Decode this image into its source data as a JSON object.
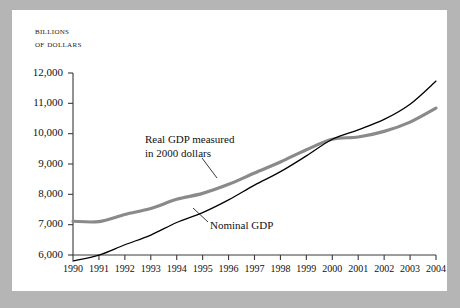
{
  "figure": {
    "background": "#ffffff",
    "page_background": "#b5b5b5"
  },
  "axis_title": {
    "line1": "Billions",
    "line2": "of dollars"
  },
  "annotations": {
    "real": {
      "line1": "Real GDP measured",
      "line2": "in 2000 dollars"
    },
    "nominal": {
      "label": "Nominal GDP"
    }
  },
  "chart_data": {
    "type": "line",
    "title": "",
    "subtitle": "",
    "xlabel": "",
    "ylabel": "Billions of dollars",
    "xlim": [
      1990,
      2004
    ],
    "ylim": [
      6000,
      12000
    ],
    "ytick_step": 1000,
    "grid": false,
    "legend": "inline-annotations",
    "x": [
      1990,
      1991,
      1992,
      1993,
      1994,
      1995,
      1996,
      1997,
      1998,
      1999,
      2000,
      2001,
      2002,
      2003,
      2004
    ],
    "xticklabels": [
      "1990",
      "1991",
      "1992",
      "1993",
      "1994",
      "1995",
      "1996",
      "1997",
      "1998",
      "1999",
      "2000",
      "2001",
      "2002",
      "2003",
      "2004"
    ],
    "yticks": [
      6000,
      7000,
      8000,
      9000,
      10000,
      11000,
      12000
    ],
    "yticklabels": [
      "6,000",
      "7,000",
      "8,000",
      "9,000",
      "10,000",
      "11,000",
      "12,000"
    ],
    "series": [
      {
        "name": "Real GDP measured in 2000 dollars",
        "color": "#8a8a8a",
        "linewidth": 3.2,
        "values": [
          7113,
          7101,
          7337,
          7533,
          7836,
          8032,
          8329,
          8704,
          9067,
          9470,
          9817,
          9891,
          10075,
          10381,
          10842
        ]
      },
      {
        "name": "Nominal GDP",
        "color": "#000000",
        "linewidth": 1.3,
        "values": [
          5803,
          5996,
          6338,
          6657,
          7072,
          7398,
          7817,
          8304,
          8747,
          9268,
          9817,
          10128,
          10470,
          10971,
          11734
        ]
      }
    ]
  }
}
